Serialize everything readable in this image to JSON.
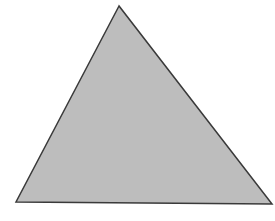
{
  "diagram": {
    "shape": "triangle",
    "vertices": {
      "apex": [
        119,
        6
      ],
      "bottom_left": [
        16,
        202
      ],
      "bottom_right": [
        272,
        204
      ]
    },
    "colors": {
      "background": "#ffffff",
      "fill": "#bdbdbd",
      "stroke": "#3a3a3a"
    },
    "stroke_width": 1.5
  }
}
